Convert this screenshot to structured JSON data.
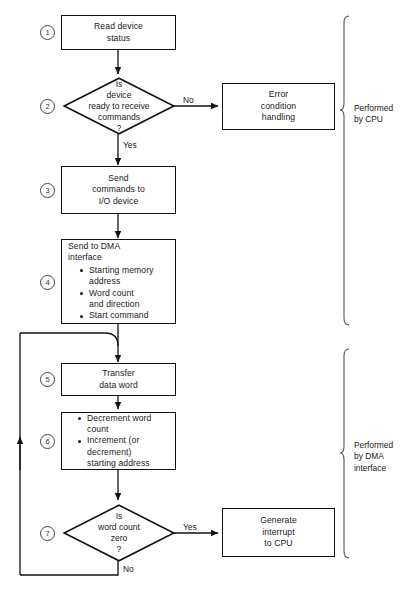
{
  "diagram": {
    "nodes": [
      {
        "id": "n1",
        "step": "1",
        "shape": "process",
        "text": "Read device\nstatus"
      },
      {
        "id": "n2",
        "step": "2",
        "shape": "decision",
        "text": "Is\ndevice\nready to receive\ncommands\n?"
      },
      {
        "id": "err",
        "step": "",
        "shape": "process",
        "text": "Error\ncondition\nhandling"
      },
      {
        "id": "n3",
        "step": "3",
        "shape": "process",
        "text": "Send\ncommands to\nI/O device"
      },
      {
        "id": "n4",
        "step": "4",
        "shape": "process-bullets",
        "head": "Send to DMA\ninterface",
        "bullets": [
          "Starting memory\naddress",
          "Word count\nand direction",
          "Start command"
        ]
      },
      {
        "id": "n5",
        "step": "5",
        "shape": "process",
        "text": "Transfer\ndata word"
      },
      {
        "id": "n6",
        "step": "6",
        "shape": "process-bullets",
        "head": "",
        "bullets": [
          "Decrement word\ncount",
          "Increment (or\ndecrement)\nstarting address"
        ]
      },
      {
        "id": "n7",
        "step": "7",
        "shape": "decision",
        "text": "Is\nword count\nzero\n?"
      },
      {
        "id": "gen",
        "step": "",
        "shape": "process",
        "text": "Generate\ninterrupt\nto CPU"
      }
    ],
    "edge_labels": {
      "no_from_device_ready": "No",
      "yes_from_device_ready": "Yes",
      "yes_from_word_count": "Yes",
      "no_from_word_count": "No"
    },
    "braces": [
      {
        "id": "brace-cpu",
        "label": "Performed\nby CPU"
      },
      {
        "id": "brace-dma",
        "label": "Performed\nby DMA\ninterface"
      }
    ],
    "colors": {
      "stroke": "#111111",
      "background": "#ffffff",
      "text": "#1a1a1a",
      "brace": "#555555"
    }
  }
}
